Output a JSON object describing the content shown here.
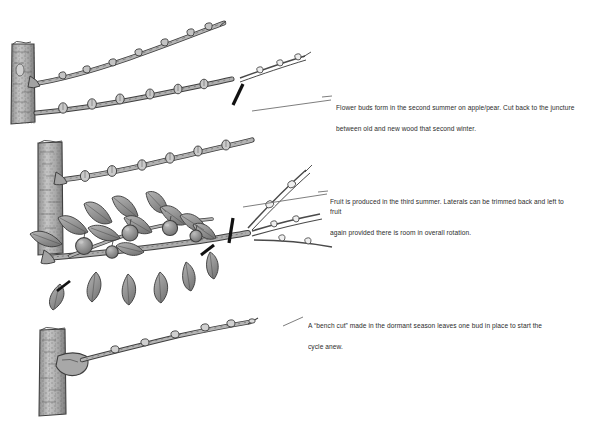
{
  "figure": {
    "medium": "pen-and-ink line drawing with gray wash",
    "background_color": "#ffffff",
    "ink_color": "#3a3a3a",
    "bark_fill": "#b9b9b9",
    "leaf_fill": "#9a9a9a",
    "fruit_fill": "#8e8e8e",
    "cut_mark_color": "#111111",
    "leader_line_color": "#6f6f6f"
  },
  "captions": [
    {
      "id": "flower-buds",
      "line1": "Flower buds form in the second summer on apple/pear. Cut back to the juncture",
      "line2": "between old and new wood that second winter."
    },
    {
      "id": "fruit-third-summer",
      "line1": "Fruit is produced in the third summer. Laterals can be trimmed back and left to fruit",
      "line2": "again provided there is room in overall rotation."
    },
    {
      "id": "bench-cut",
      "line1": "A “bench cut” made in the dormant season leaves one bud in place to start the",
      "line2": "cycle anew."
    }
  ],
  "panels": [
    {
      "id": "panel-1-dormant-shoot",
      "label": "first-year shoot with buds rising from trunk",
      "has_cut_mark": false
    },
    {
      "id": "panel-2-flower-buds",
      "label": "second-summer branch bearing plump flower buds with new whip growth",
      "has_cut_mark": true
    },
    {
      "id": "panel-3-fruiting",
      "label": "third-summer branch with leaves and fruit, laterals marked for trimming",
      "has_cut_mark": true
    },
    {
      "id": "panel-4-bench-cut",
      "label": "dormant branch after bench cut leaving one bud",
      "has_cut_mark": false
    }
  ]
}
